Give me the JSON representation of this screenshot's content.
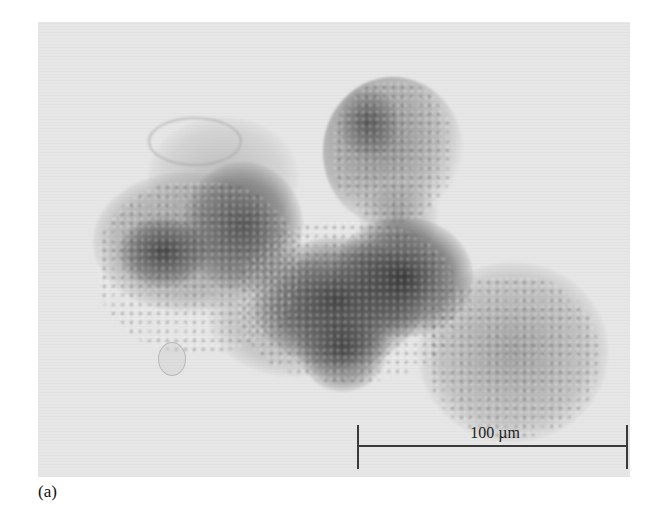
{
  "figure": {
    "panel_label": "(a)",
    "image": {
      "type": "brightfield micrograph",
      "subject": "irregular aggregate of particles / floc",
      "background_color": "#e6e6e6",
      "specimen_dark_color": "#3c3c3c",
      "specimen_light_color": "#9a9a9a"
    },
    "scale_bar": {
      "label": "100 µm",
      "color": "#3a3a3a"
    }
  }
}
